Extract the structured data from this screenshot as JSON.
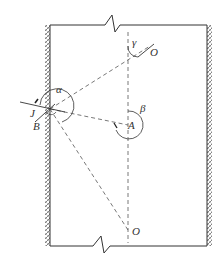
{
  "diagram": {
    "labels": {
      "alpha": "α",
      "beta": "β",
      "gamma": "γ",
      "J": "J",
      "B": "B",
      "A": "A",
      "O_top": "O",
      "O_bottom": "O"
    },
    "colors": {
      "line": "#333333",
      "dash": "#555555",
      "hatch": "#666666",
      "background": "#ffffff"
    }
  }
}
